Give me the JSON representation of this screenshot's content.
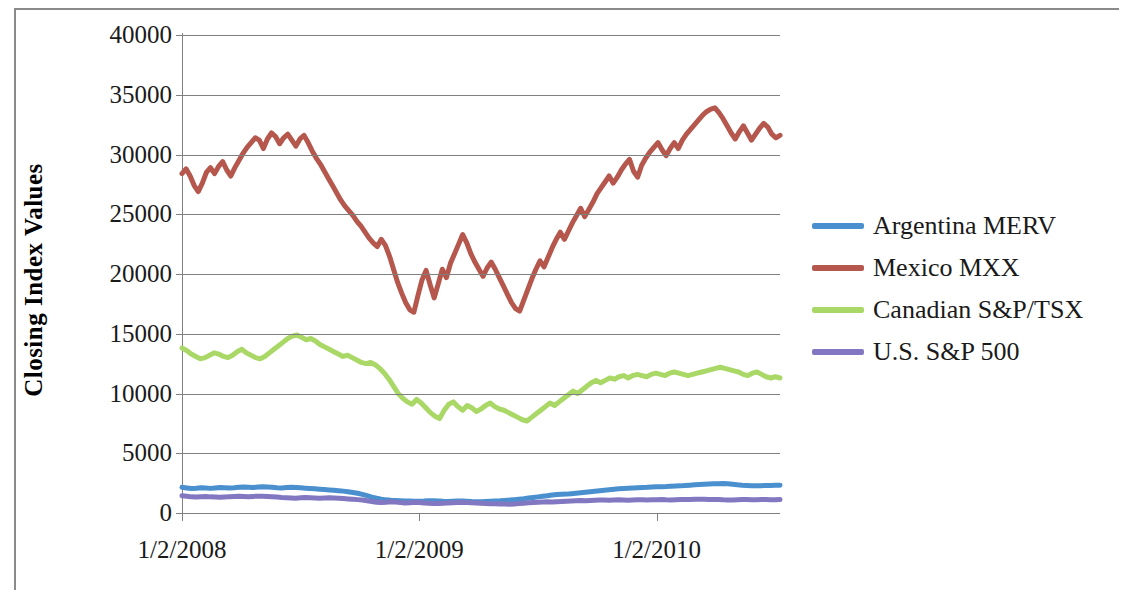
{
  "chart_data": {
    "type": "line",
    "title": "",
    "xlabel": "",
    "ylabel": "Closing Index Values",
    "ylim": [
      0,
      40000
    ],
    "yticks": [
      "0",
      "5000",
      "10000",
      "15000",
      "20000",
      "25000",
      "30000",
      "35000",
      "40000"
    ],
    "ytick_values": [
      0,
      5000,
      10000,
      15000,
      20000,
      25000,
      30000,
      35000,
      40000
    ],
    "xticks": [
      "1/2/2008",
      "1/2/2009",
      "1/2/2010"
    ],
    "xtick_values": [
      2008.0,
      2009.0,
      2010.0
    ],
    "xlim": [
      2008.0,
      2010.52
    ],
    "grid": true,
    "legend_position": "right",
    "colors": {
      "argentina": "#4a90cf",
      "mexico": "#b5574c",
      "canada": "#a9d867",
      "us": "#8278c2",
      "gridline": "#808080",
      "axis": "#808080",
      "text": "#1a1a1a",
      "border": "#8a8a8a",
      "background": "#ffffff"
    },
    "series": [
      {
        "name": "Argentina MERV",
        "color": "#4a90cf",
        "values": [
          2150,
          2100,
          2050,
          2080,
          2120,
          2090,
          2060,
          2100,
          2140,
          2120,
          2090,
          2110,
          2150,
          2180,
          2160,
          2130,
          2170,
          2200,
          2180,
          2150,
          2120,
          2100,
          2130,
          2160,
          2140,
          2110,
          2080,
          2050,
          2020,
          1990,
          1960,
          1930,
          1900,
          1870,
          1830,
          1780,
          1720,
          1650,
          1560,
          1450,
          1330,
          1230,
          1150,
          1100,
          1070,
          1050,
          1030,
          1010,
          1000,
          990,
          980,
          1000,
          1030,
          1020,
          1000,
          980,
          970,
          990,
          1010,
          1000,
          980,
          960,
          950,
          940,
          960,
          980,
          1000,
          1020,
          1050,
          1080,
          1120,
          1160,
          1200,
          1250,
          1300,
          1350,
          1400,
          1450,
          1500,
          1540,
          1560,
          1580,
          1620,
          1660,
          1700,
          1740,
          1780,
          1820,
          1860,
          1900,
          1940,
          1980,
          2020,
          2050,
          2080,
          2100,
          2120,
          2140,
          2150,
          2170,
          2190,
          2200,
          2210,
          2230,
          2250,
          2270,
          2300,
          2330,
          2360,
          2380,
          2400,
          2420,
          2440,
          2450,
          2460,
          2440,
          2400,
          2360,
          2330,
          2310,
          2290,
          2280,
          2290,
          2300,
          2310,
          2320,
          2330
        ]
      },
      {
        "name": "Mexico MXX",
        "color": "#b5574c",
        "values": [
          28400,
          28800,
          28200,
          27400,
          26900,
          27600,
          28500,
          28900,
          28400,
          29000,
          29400,
          28700,
          28200,
          28900,
          29500,
          30100,
          30600,
          31000,
          31400,
          31200,
          30500,
          31300,
          31800,
          31500,
          30900,
          31400,
          31700,
          31200,
          30700,
          31300,
          31600,
          31000,
          30300,
          29700,
          29200,
          28600,
          28000,
          27400,
          26800,
          26200,
          25700,
          25300,
          24900,
          24400,
          24000,
          23500,
          23000,
          22600,
          22300,
          22900,
          22400,
          21500,
          20400,
          19300,
          18400,
          17600,
          17000,
          16800,
          18200,
          19500,
          20300,
          19100,
          18000,
          19200,
          20400,
          19700,
          20900,
          21700,
          22500,
          23300,
          22600,
          21700,
          21000,
          20400,
          19800,
          20500,
          21000,
          20400,
          19700,
          19000,
          18300,
          17600,
          17100,
          16900,
          17800,
          18700,
          19600,
          20400,
          21100,
          20600,
          21400,
          22200,
          22900,
          23500,
          22900,
          23600,
          24300,
          24900,
          25500,
          24800,
          25400,
          26000,
          26700,
          27200,
          27700,
          28200,
          27600,
          28100,
          28700,
          29200,
          29600,
          28600,
          28100,
          29100,
          29700,
          30200,
          30600,
          31000,
          30400,
          29900,
          30500,
          31000,
          30500,
          31200,
          31700,
          32100,
          32500,
          32900,
          33300,
          33600,
          33800,
          33900,
          33500,
          33000,
          32400,
          31800,
          31300,
          31900,
          32400,
          31800,
          31200,
          31700,
          32200,
          32600,
          32300,
          31700,
          31400,
          31600
        ]
      },
      {
        "name": "Canadian S&P/TSX",
        "color": "#a9d867",
        "values": [
          13800,
          13600,
          13300,
          13100,
          12900,
          13000,
          13200,
          13400,
          13300,
          13100,
          13000,
          13200,
          13500,
          13700,
          13400,
          13200,
          13000,
          12900,
          13100,
          13400,
          13700,
          14000,
          14300,
          14600,
          14800,
          14900,
          14700,
          14500,
          14600,
          14400,
          14100,
          13900,
          13700,
          13500,
          13300,
          13100,
          13200,
          13000,
          12800,
          12600,
          12500,
          12600,
          12400,
          12100,
          11700,
          11200,
          10600,
          10000,
          9600,
          9300,
          9100,
          9500,
          9200,
          8800,
          8400,
          8100,
          7900,
          8600,
          9100,
          9300,
          8900,
          8600,
          9000,
          8800,
          8500,
          8700,
          9000,
          9200,
          8900,
          8700,
          8600,
          8400,
          8200,
          8000,
          7800,
          7700,
          8000,
          8300,
          8600,
          8900,
          9200,
          9000,
          9300,
          9600,
          9900,
          10200,
          10000,
          10300,
          10600,
          10900,
          11100,
          10900,
          11100,
          11300,
          11200,
          11400,
          11500,
          11300,
          11500,
          11600,
          11500,
          11400,
          11600,
          11700,
          11600,
          11500,
          11700,
          11800,
          11700,
          11600,
          11500,
          11600,
          11700,
          11800,
          11900,
          12000,
          12100,
          12200,
          12100,
          12000,
          11900,
          11800,
          11600,
          11500,
          11700,
          11800,
          11600,
          11400,
          11300,
          11400,
          11300
        ]
      },
      {
        "name": "U.S. S&P 500",
        "color": "#8278c2",
        "values": [
          1450,
          1400,
          1350,
          1330,
          1360,
          1390,
          1350,
          1330,
          1310,
          1340,
          1370,
          1390,
          1400,
          1380,
          1360,
          1390,
          1410,
          1400,
          1380,
          1360,
          1330,
          1300,
          1280,
          1260,
          1240,
          1270,
          1290,
          1270,
          1250,
          1230,
          1260,
          1280,
          1260,
          1240,
          1210,
          1180,
          1150,
          1120,
          1080,
          1020,
          960,
          900,
          870,
          900,
          940,
          910,
          870,
          840,
          860,
          890,
          870,
          840,
          820,
          800,
          790,
          810,
          830,
          850,
          870,
          890,
          870,
          850,
          830,
          810,
          790,
          780,
          770,
          760,
          750,
          740,
          760,
          790,
          820,
          850,
          880,
          900,
          920,
          940,
          930,
          950,
          970,
          990,
          1010,
          1030,
          1050,
          1030,
          1050,
          1070,
          1090,
          1080,
          1060,
          1080,
          1100,
          1090,
          1070,
          1090,
          1110,
          1100,
          1090,
          1100,
          1110,
          1120,
          1100,
          1090,
          1110,
          1120,
          1130,
          1140,
          1150,
          1160,
          1150,
          1140,
          1130,
          1120,
          1100,
          1090,
          1080,
          1100,
          1120,
          1130,
          1110,
          1100,
          1120,
          1130,
          1110,
          1100,
          1120
        ]
      }
    ]
  },
  "axis": {
    "y_title": "Closing Index Values",
    "y_labels": [
      "40000",
      "35000",
      "30000",
      "25000",
      "20000",
      "15000",
      "10000",
      "5000",
      "0"
    ],
    "x_labels": [
      "1/2/2008",
      "1/2/2009",
      "1/2/2010"
    ]
  },
  "legend": {
    "items": [
      {
        "label": "Argentina MERV",
        "color": "#4a90cf"
      },
      {
        "label": "Mexico MXX",
        "color": "#b5574c"
      },
      {
        "label": "Canadian S&P/TSX",
        "color": "#a9d867"
      },
      {
        "label": "U.S. S&P 500",
        "color": "#8278c2"
      }
    ]
  }
}
